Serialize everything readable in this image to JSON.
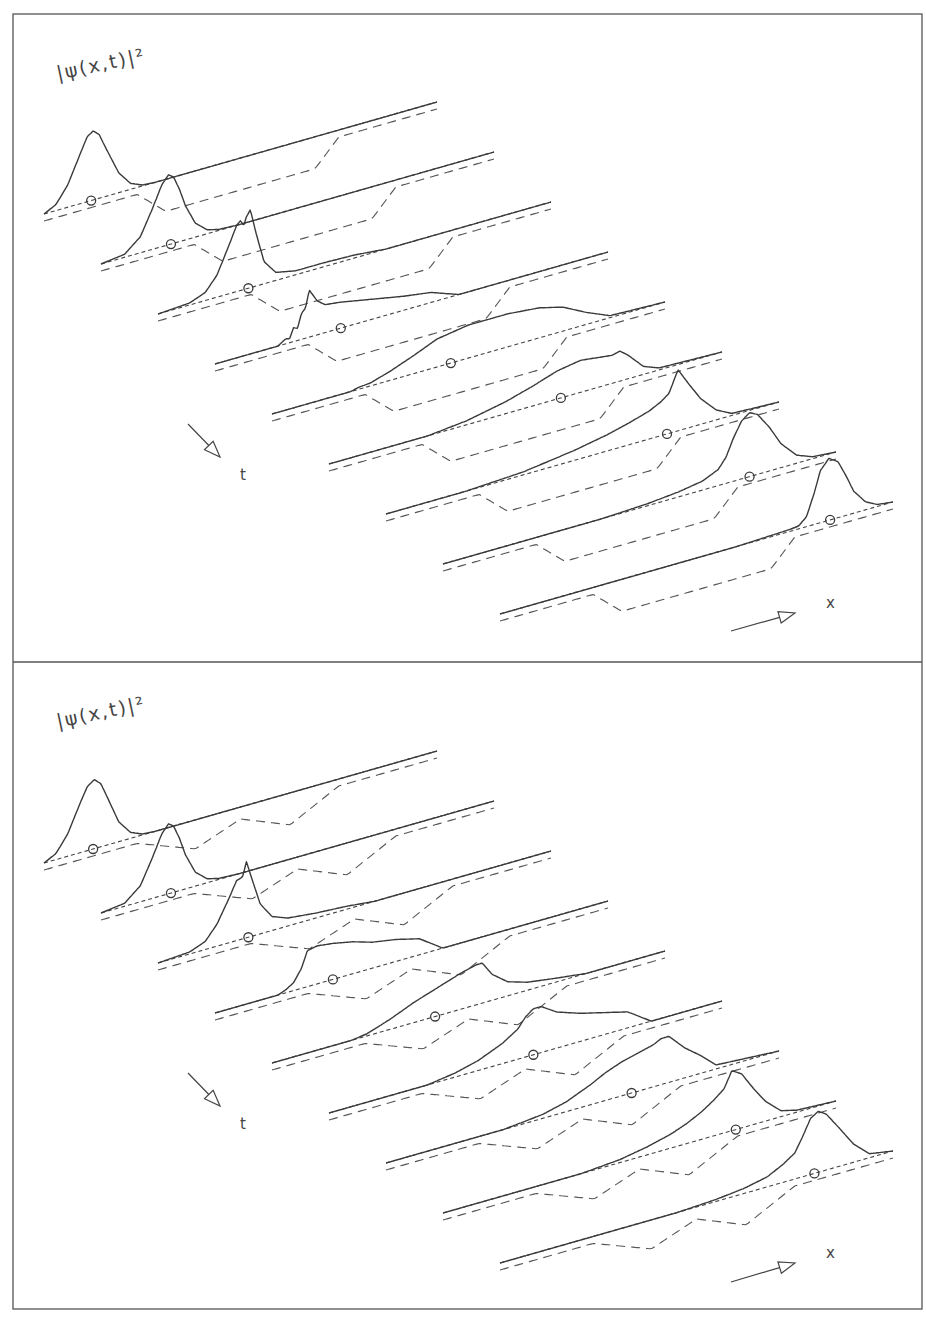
{
  "figure": {
    "width": 926,
    "height": 1326,
    "frame": {
      "x": 13,
      "y": 14,
      "w": 909,
      "h": 1295,
      "divider_y": 662
    },
    "colors": {
      "ink": "#3a3a3a",
      "background": "#ffffff"
    }
  },
  "chart_data": [
    {
      "type": "line",
      "subtype": "waterfall-3d",
      "title": "",
      "panel": "top",
      "ylabel": "|ψ(x,t)|²",
      "xlabel": "x",
      "tlabel": "t",
      "potential": "single square well",
      "legend": [],
      "origin": {
        "x": 44,
        "y": 214
      },
      "slice_step": {
        "dx": 57,
        "dy": 50
      },
      "axis_vec": {
        "dx": 393,
        "dy": -112
      },
      "dash_offset": 7,
      "potential_profile": {
        "u": [
          0,
          0.237,
          0.31,
          0.69,
          0.75,
          1
        ],
        "depth": [
          0,
          0,
          25,
          25,
          0,
          0
        ]
      },
      "label_pos": {
        "ylabel": {
          "x": 58,
          "y": 80
        },
        "t": {
          "x": 240,
          "y": 480
        },
        "x": {
          "x": 826,
          "y": 608
        },
        "t_arrow": [
          [
            188,
            424
          ],
          [
            220,
            457
          ]
        ],
        "x_arrow": [
          [
            731,
            631
          ],
          [
            795,
            613
          ]
        ]
      },
      "slices": [
        {
          "t_index": 1,
          "mean_u": 0.12,
          "u": [
            0,
            0.03,
            0.06,
            0.09,
            0.11,
            0.125,
            0.14,
            0.16,
            0.19,
            0.22,
            0.25,
            0.28,
            1
          ],
          "h": [
            0,
            6,
            22,
            48,
            65,
            69,
            64,
            46,
            20,
            6,
            1,
            0,
            0
          ]
        },
        {
          "t_index": 2,
          "mean_u": 0.178,
          "u": [
            0,
            0.06,
            0.1,
            0.13,
            0.155,
            0.172,
            0.185,
            0.2,
            0.215,
            0.24,
            0.27,
            0.3,
            0.35,
            1
          ],
          "h": [
            0,
            3,
            16,
            40,
            62,
            70,
            66,
            52,
            34,
            14,
            4,
            1,
            0,
            0
          ]
        },
        {
          "t_index": 3,
          "mean_u": 0.23,
          "u": [
            0,
            0.08,
            0.12,
            0.15,
            0.18,
            0.2,
            0.21,
            0.218,
            0.225,
            0.235,
            0.25,
            0.27,
            0.3,
            0.35,
            0.42,
            0.5,
            0.58,
            1
          ],
          "h": [
            0,
            2,
            8,
            22,
            48,
            66,
            70,
            64,
            72,
            78,
            52,
            22,
            8,
            4,
            4,
            3,
            0,
            0
          ]
        },
        {
          "t_index": 4,
          "mean_u": 0.32,
          "u": [
            0,
            0.16,
            0.18,
            0.19,
            0.2,
            0.21,
            0.22,
            0.23,
            0.24,
            0.26,
            0.28,
            0.32,
            0.4,
            0.48,
            0.55,
            0.62,
            1
          ],
          "h": [
            0,
            0,
            5,
            4,
            14,
            12,
            26,
            30,
            47,
            34,
            28,
            26,
            20,
            14,
            10,
            0,
            0
          ]
        },
        {
          "t_index": 5,
          "mean_u": 0.455,
          "u": [
            0,
            0.2,
            0.22,
            0.25,
            0.3,
            0.36,
            0.42,
            0.5,
            0.6,
            0.68,
            0.74,
            0.8,
            0.86,
            1
          ],
          "h": [
            0,
            0,
            2,
            3,
            9,
            18,
            28,
            33,
            33,
            30,
            24,
            12,
            2,
            0
          ]
        },
        {
          "t_index": 6,
          "mean_u": 0.59,
          "u": [
            0,
            0.25,
            0.35,
            0.45,
            0.52,
            0.58,
            0.64,
            0.68,
            0.72,
            0.74,
            0.76,
            0.8,
            0.84,
            1
          ],
          "h": [
            0,
            0,
            4,
            12,
            20,
            28,
            32,
            30,
            28,
            30,
            24,
            8,
            2,
            0
          ]
        },
        {
          "t_index": 7,
          "mean_u": 0.715,
          "u": [
            0,
            0.2,
            0.35,
            0.48,
            0.56,
            0.62,
            0.67,
            0.7,
            0.72,
            0.743,
            0.77,
            0.8,
            0.84,
            0.88,
            1
          ],
          "h": [
            0,
            0,
            3,
            10,
            16,
            22,
            28,
            34,
            40,
            61,
            44,
            26,
            10,
            2,
            0
          ]
        },
        {
          "t_index": 8,
          "mean_u": 0.78,
          "u": [
            0,
            0.4,
            0.52,
            0.6,
            0.66,
            0.7,
            0.72,
            0.74,
            0.76,
            0.78,
            0.8,
            0.83,
            0.86,
            0.9,
            0.94,
            1
          ],
          "h": [
            0,
            0,
            2,
            5,
            9,
            16,
            26,
            44,
            58,
            64,
            60,
            44,
            24,
            8,
            2,
            0
          ]
        },
        {
          "t_index": 9,
          "mean_u": 0.84,
          "u": [
            0,
            0.6,
            0.74,
            0.76,
            0.78,
            0.8,
            0.815,
            0.837,
            0.86,
            0.88,
            0.9,
            0.93,
            0.96,
            1
          ],
          "h": [
            0,
            0,
            2,
            3,
            10,
            32,
            52,
            62,
            56,
            40,
            22,
            8,
            2,
            0
          ]
        }
      ]
    },
    {
      "type": "line",
      "subtype": "waterfall-3d",
      "title": "",
      "panel": "bottom",
      "ylabel": "|ψ(x,t)|²",
      "xlabel": "x",
      "tlabel": "t",
      "potential": "double well with central barrier",
      "legend": [],
      "origin": {
        "x": 44,
        "y": 863
      },
      "slice_step": {
        "dx": 57,
        "dy": 50
      },
      "axis_vec": {
        "dx": 393,
        "dy": -112
      },
      "dash_offset": 7,
      "potential_profile": {
        "u": [
          0,
          0.237,
          0.385,
          0.5,
          0.626,
          0.75,
          1
        ],
        "depth": [
          0,
          0,
          22,
          5,
          25,
          0,
          0
        ]
      },
      "label_pos": {
        "ylabel": {
          "x": 58,
          "y": 728
        },
        "t": {
          "x": 240,
          "y": 1129
        },
        "x": {
          "x": 826,
          "y": 1258
        },
        "t_arrow": [
          [
            188,
            1073
          ],
          [
            220,
            1106
          ]
        ],
        "x_arrow": [
          [
            731,
            1282
          ],
          [
            795,
            1263
          ]
        ]
      },
      "slices": [
        {
          "t_index": 1,
          "mean_u": 0.125,
          "u": [
            0,
            0.03,
            0.06,
            0.09,
            0.11,
            0.128,
            0.145,
            0.165,
            0.19,
            0.22,
            0.25,
            0.28,
            1
          ],
          "h": [
            0,
            6,
            22,
            48,
            64,
            69,
            63,
            44,
            20,
            6,
            1,
            0,
            0
          ]
        },
        {
          "t_index": 2,
          "mean_u": 0.178,
          "u": [
            0,
            0.06,
            0.1,
            0.13,
            0.155,
            0.172,
            0.185,
            0.2,
            0.215,
            0.24,
            0.27,
            0.3,
            0.35,
            1
          ],
          "h": [
            0,
            3,
            16,
            40,
            62,
            70,
            66,
            52,
            34,
            14,
            4,
            1,
            0,
            0
          ]
        },
        {
          "t_index": 3,
          "mean_u": 0.23,
          "u": [
            0,
            0.08,
            0.12,
            0.15,
            0.18,
            0.2,
            0.215,
            0.225,
            0.24,
            0.26,
            0.29,
            0.33,
            0.4,
            0.48,
            0.55,
            1
          ],
          "h": [
            0,
            2,
            8,
            22,
            44,
            60,
            62,
            76,
            56,
            30,
            14,
            8,
            5,
            3,
            0,
            0
          ]
        },
        {
          "t_index": 4,
          "mean_u": 0.3,
          "u": [
            0,
            0.16,
            0.18,
            0.2,
            0.21,
            0.22,
            0.235,
            0.26,
            0.3,
            0.35,
            0.4,
            0.46,
            0.52,
            0.58,
            1
          ],
          "h": [
            0,
            0,
            3,
            8,
            14,
            20,
            36,
            38,
            36,
            32,
            26,
            22,
            16,
            0,
            0
          ]
        },
        {
          "t_index": 5,
          "mean_u": 0.415,
          "u": [
            0,
            0.2,
            0.24,
            0.3,
            0.36,
            0.42,
            0.48,
            0.52,
            0.535,
            0.56,
            0.6,
            0.65,
            0.72,
            0.8,
            1
          ],
          "h": [
            0,
            0,
            2,
            10,
            20,
            28,
            36,
            40,
            40,
            26,
            14,
            8,
            4,
            0,
            0
          ]
        },
        {
          "t_index": 6,
          "mean_u": 0.52,
          "u": [
            0,
            0.25,
            0.32,
            0.38,
            0.44,
            0.48,
            0.5,
            0.52,
            0.54,
            0.58,
            0.64,
            0.7,
            0.76,
            0.82,
            1
          ],
          "h": [
            0,
            0,
            4,
            10,
            20,
            30,
            40,
            46,
            46,
            36,
            28,
            22,
            16,
            0,
            0
          ]
        },
        {
          "t_index": 7,
          "mean_u": 0.625,
          "u": [
            0,
            0.3,
            0.4,
            0.46,
            0.52,
            0.56,
            0.6,
            0.64,
            0.68,
            0.7,
            0.72,
            0.76,
            0.8,
            0.84,
            1
          ],
          "h": [
            0,
            0,
            4,
            10,
            20,
            28,
            34,
            38,
            42,
            46,
            46,
            30,
            18,
            4,
            0
          ]
        },
        {
          "t_index": 8,
          "mean_u": 0.745,
          "u": [
            0,
            0.35,
            0.45,
            0.52,
            0.58,
            0.62,
            0.66,
            0.69,
            0.715,
            0.735,
            0.76,
            0.79,
            0.82,
            0.86,
            0.9,
            1
          ],
          "h": [
            0,
            0,
            3,
            8,
            14,
            20,
            28,
            36,
            44,
            60,
            54,
            36,
            20,
            6,
            2,
            0
          ]
        },
        {
          "t_index": 9,
          "mean_u": 0.8,
          "u": [
            0,
            0.45,
            0.55,
            0.62,
            0.68,
            0.72,
            0.75,
            0.77,
            0.79,
            0.81,
            0.83,
            0.86,
            0.9,
            0.94,
            1
          ],
          "h": [
            0,
            0,
            2,
            5,
            10,
            18,
            26,
            40,
            56,
            61,
            56,
            40,
            18,
            4,
            0
          ]
        }
      ]
    }
  ],
  "panels": [
    {
      "ylabel": "|ψ(x,t)|²",
      "t_axis_label": "t",
      "x_axis_label": "x"
    },
    {
      "ylabel": "|ψ(x,t)|²",
      "t_axis_label": "t",
      "x_axis_label": "x"
    }
  ],
  "icons": {
    "t_arrow": "arrow-down-right-icon",
    "x_arrow": "arrow-right-icon",
    "mean_marker": "circle-marker-icon"
  }
}
